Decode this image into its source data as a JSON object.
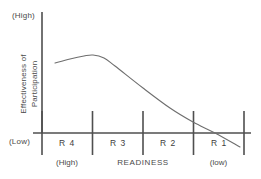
{
  "chart_data": {
    "type": "line",
    "title": "",
    "subtitle": "",
    "ylabel": "Effectiveness of Participation",
    "ylabel_line1": "Effectiveness of",
    "ylabel_line2": "Participation",
    "xlabel": "READINESS",
    "y_axis_top_label": "(High)",
    "y_axis_bottom_label": "(Low)",
    "x_axis_left_note": "(High)",
    "x_axis_right_note": "(low)",
    "categories": [
      "R 4",
      "R 3",
      "R 2",
      "R 1"
    ],
    "grid": false,
    "legend": false,
    "axis_color": "#4f4f4f",
    "curve_color": "#6e6e6e",
    "series": [
      {
        "name": "Effectiveness of Participation",
        "points": [
          {
            "x": 55,
            "y": 63
          },
          {
            "x": 70,
            "y": 59
          },
          {
            "x": 84,
            "y": 56
          },
          {
            "x": 93,
            "y": 55
          },
          {
            "x": 104,
            "y": 58
          },
          {
            "x": 115,
            "y": 66
          },
          {
            "x": 143,
            "y": 88
          },
          {
            "x": 170,
            "y": 108
          },
          {
            "x": 193,
            "y": 122
          },
          {
            "x": 215,
            "y": 133
          },
          {
            "x": 240,
            "y": 147
          }
        ],
        "description": "Participation effectiveness rises slightly through R4, peaks near the R4/R3 boundary, then declines steadily through R3, R2 and R1, crossing the baseline within R1."
      }
    ],
    "axis_geometry": {
      "y_axis_x": 42,
      "y_axis_top": 12,
      "x_axis_y": 133,
      "x_axis_left": 33,
      "x_axis_right": 251,
      "tick_positions": [
        42,
        92,
        143,
        193,
        244
      ],
      "tick_top": 111,
      "tick_bottom": 155
    }
  },
  "regions": [
    {
      "label": "R 4",
      "left": 42,
      "width": 50
    },
    {
      "label": "R 3",
      "left": 93,
      "width": 50
    },
    {
      "label": "R 2",
      "left": 143,
      "width": 50
    },
    {
      "label": "R 1",
      "left": 194,
      "width": 50
    }
  ]
}
